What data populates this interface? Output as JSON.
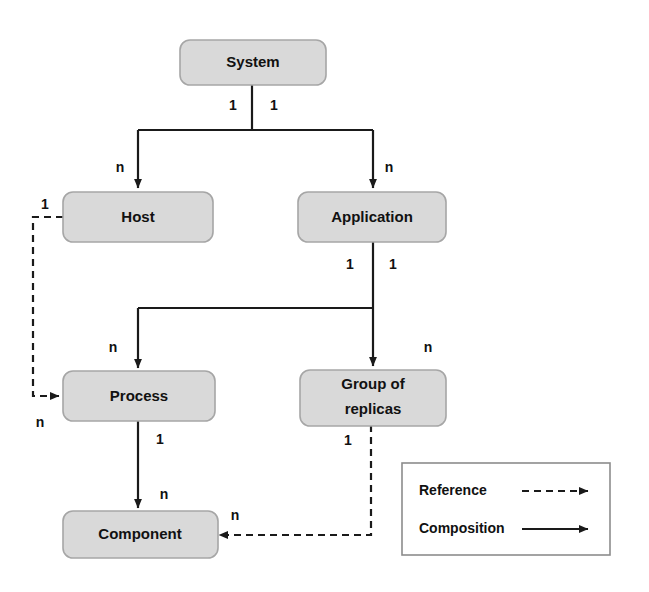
{
  "diagram": {
    "colors": {
      "node_fill": "#d9d9d9",
      "node_stroke": "#a6a6a6",
      "edge": "#1a1a1a",
      "background": "#ffffff",
      "legend_stroke": "#8c8c8c"
    },
    "nodes": [
      {
        "id": "system",
        "label": "System"
      },
      {
        "id": "host",
        "label": "Host"
      },
      {
        "id": "application",
        "label": "Application"
      },
      {
        "id": "process",
        "label": "Process"
      },
      {
        "id": "group_of_replicas",
        "label_line1": "Group of",
        "label_line2": "replicas"
      },
      {
        "id": "component",
        "label": "Component"
      }
    ],
    "edges": [
      {
        "id": "system-host",
        "from": "System",
        "to": "Host",
        "type": "Composition",
        "source_cardinality": "1",
        "target_cardinality": "n"
      },
      {
        "id": "system-application",
        "from": "System",
        "to": "Application",
        "type": "Composition",
        "source_cardinality": "1",
        "target_cardinality": "n"
      },
      {
        "id": "application-process",
        "from": "Application",
        "to": "Process",
        "type": "Composition",
        "source_cardinality": "1",
        "target_cardinality": "n"
      },
      {
        "id": "application-group",
        "from": "Application",
        "to": "Group of replicas",
        "type": "Composition",
        "source_cardinality": "1",
        "target_cardinality": "n"
      },
      {
        "id": "process-component",
        "from": "Process",
        "to": "Component",
        "type": "Composition",
        "source_cardinality": "1",
        "target_cardinality": "n"
      },
      {
        "id": "host-process",
        "from": "Host",
        "to": "Process",
        "type": "Reference",
        "source_cardinality": "1",
        "target_cardinality": "n"
      },
      {
        "id": "group-component",
        "from": "Group of replicas",
        "to": "Component",
        "type": "Reference",
        "source_cardinality": "1",
        "target_cardinality": "n"
      }
    ],
    "cardinality_labels": {
      "system_left": "1",
      "system_right": "1",
      "host_in": "n",
      "application_in": "n",
      "application_left": "1",
      "application_right": "1",
      "process_in": "n",
      "group_in": "n",
      "process_out": "1",
      "component_in": "n",
      "host_ref_out": "1",
      "process_ref_in": "n",
      "group_ref_out": "1",
      "component_ref_in": "n"
    },
    "legend": {
      "items": [
        {
          "id": "reference",
          "label": "Reference",
          "line_style": "dashed"
        },
        {
          "id": "composition",
          "label": "Composition",
          "line_style": "solid"
        }
      ]
    }
  }
}
